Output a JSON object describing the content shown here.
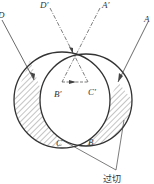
{
  "diagram": {
    "type": "geometric-optics",
    "labels": {
      "D": "D",
      "D_prime": "D′",
      "A_prime": "A′",
      "A": "A",
      "B_prime": "B′",
      "C_prime": "C′",
      "C": "C",
      "B": "B",
      "overcut": "过切"
    },
    "colors": {
      "stroke": "#333333",
      "background": "#ffffff"
    }
  }
}
